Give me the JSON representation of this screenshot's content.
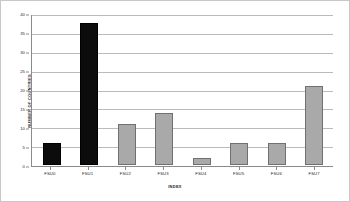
{
  "chart_data": {
    "type": "bar",
    "title": "",
    "categories": [
      "FSU0",
      "FSU1",
      "FSU2",
      "FSU3",
      "FSU4",
      "FSU5",
      "FSU6",
      "FSU7"
    ],
    "values": [
      6,
      38,
      11,
      14,
      2,
      6,
      6,
      21
    ],
    "bar_colors": [
      "#0c0c0c",
      "#0c0c0c",
      "#a9a9a9",
      "#a9a9a9",
      "#a9a9a9",
      "#a9a9a9",
      "#a9a9a9",
      "#a9a9a9"
    ],
    "xlabel": "INDEX",
    "ylabel": "NUMBER OF COUNTRIES",
    "ylim": [
      0,
      40
    ],
    "ytick_step": 5,
    "yticks": [
      0,
      5,
      10,
      15,
      20,
      25,
      30,
      35,
      40
    ],
    "ytick_labels": [
      "0",
      "5",
      "10",
      "15",
      "20",
      "25",
      "30",
      "35",
      "40"
    ],
    "grid": true,
    "grid_axis": "y",
    "legend": false,
    "legend_position": "none",
    "gridline_color": "#bcbcbc",
    "axis_color": "#8a8a8a",
    "frame_color": "#c8c8c8",
    "background": "#ffffff"
  }
}
